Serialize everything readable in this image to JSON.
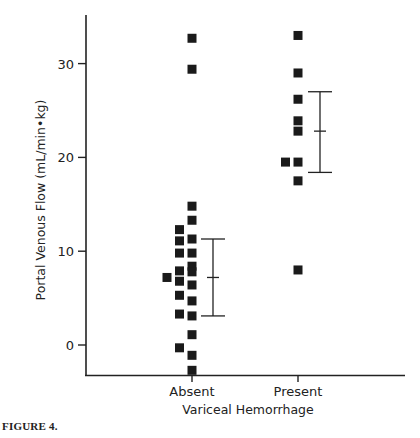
{
  "caption": "FIGURE 4.",
  "chart_data": {
    "type": "scatter",
    "title": "",
    "xlabel": "Variceal Hemorrhage",
    "ylabel": "Portal Venous Flow (mL/min•kg)",
    "categories": [
      "Absent",
      "Present"
    ],
    "yticks": [
      0,
      10,
      20,
      30
    ],
    "ylim": [
      -3.2,
      35
    ],
    "grid": false,
    "legend": null,
    "series": [
      {
        "name": "Absent",
        "points": [
          {
            "offset": 0,
            "y": 32.7
          },
          {
            "offset": 0,
            "y": 29.4
          },
          {
            "offset": 0,
            "y": 14.8
          },
          {
            "offset": 0,
            "y": 13.3
          },
          {
            "offset": 0,
            "y": 11.3
          },
          {
            "offset": 0,
            "y": 9.8
          },
          {
            "offset": 0,
            "y": 8.4
          },
          {
            "offset": 0,
            "y": 7.8
          },
          {
            "offset": 0,
            "y": 6.4
          },
          {
            "offset": 0,
            "y": 4.7
          },
          {
            "offset": 0,
            "y": 3.1
          },
          {
            "offset": 0,
            "y": 1.1
          },
          {
            "offset": 0,
            "y": -1.1
          },
          {
            "offset": 0,
            "y": -2.7
          },
          {
            "offset": -1,
            "y": 12.3
          },
          {
            "offset": -1,
            "y": 11.1
          },
          {
            "offset": -1,
            "y": 9.8
          },
          {
            "offset": -1,
            "y": 7.9
          },
          {
            "offset": -1,
            "y": 6.8
          },
          {
            "offset": -1,
            "y": 5.3
          },
          {
            "offset": -1,
            "y": 3.3
          },
          {
            "offset": -1,
            "y": -0.3
          },
          {
            "offset": -2,
            "y": 7.2
          }
        ],
        "mean": 7.2,
        "error_upper": 11.3,
        "error_lower": 3.1
      },
      {
        "name": "Present",
        "points": [
          {
            "offset": 0,
            "y": 33.0
          },
          {
            "offset": 0,
            "y": 29.0
          },
          {
            "offset": 0,
            "y": 26.2
          },
          {
            "offset": 0,
            "y": 23.9
          },
          {
            "offset": 0,
            "y": 22.8
          },
          {
            "offset": 0,
            "y": 19.5
          },
          {
            "offset": -1,
            "y": 19.5
          },
          {
            "offset": 0,
            "y": 17.5
          },
          {
            "offset": 0,
            "y": 8.0
          }
        ],
        "mean": 22.8,
        "error_upper": 27.0,
        "error_lower": 18.4
      }
    ]
  }
}
